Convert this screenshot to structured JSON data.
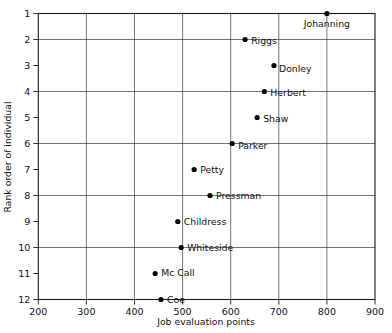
{
  "chart_data": {
    "type": "scatter",
    "title": "",
    "xlabel": "Job evaluation points",
    "ylabel": "Rank order of individual",
    "xlim": [
      200,
      900
    ],
    "ylim": [
      1,
      12
    ],
    "y_inverted": true,
    "grid": true,
    "legend": "none",
    "x_ticks": [
      200,
      300,
      400,
      500,
      600,
      700,
      800,
      900
    ],
    "x_tick_labels": [
      "200",
      "300",
      "400",
      "500",
      "600",
      "700",
      "800",
      "900"
    ],
    "y_ticks": [
      1,
      2,
      3,
      4,
      5,
      6,
      7,
      8,
      9,
      10,
      11,
      12
    ],
    "y_tick_labels": [
      "1",
      "2",
      "3",
      "4",
      "5",
      "6",
      "7",
      "8",
      "9",
      "10",
      "11",
      "12"
    ],
    "x_gridlines": [
      300,
      400,
      500,
      600,
      700,
      800
    ],
    "y_gridlines": [
      2,
      4,
      6,
      8,
      10,
      12
    ],
    "point_color": "#000000",
    "points": [
      {
        "label": "Johanning",
        "x": 800,
        "y": 1,
        "label_dx": 0,
        "label_dy": 13,
        "anchor": "middle"
      },
      {
        "label": "Riggs",
        "x": 630,
        "y": 2,
        "label_dx": 6,
        "label_dy": 4,
        "anchor": "start"
      },
      {
        "label": "Donley",
        "x": 690,
        "y": 3,
        "label_dx": 5,
        "label_dy": 6,
        "anchor": "start"
      },
      {
        "label": "Herbert",
        "x": 670,
        "y": 4,
        "label_dx": 6,
        "label_dy": 4,
        "anchor": "start"
      },
      {
        "label": "Shaw",
        "x": 655,
        "y": 5,
        "label_dx": 6,
        "label_dy": 4,
        "anchor": "start"
      },
      {
        "label": "Parker",
        "x": 603,
        "y": 6,
        "label_dx": 6,
        "label_dy": 5,
        "anchor": "start"
      },
      {
        "label": "Petty",
        "x": 524,
        "y": 7,
        "label_dx": 6,
        "label_dy": 3,
        "anchor": "start"
      },
      {
        "label": "Pressman",
        "x": 557,
        "y": 8,
        "label_dx": 6,
        "label_dy": 3,
        "anchor": "start"
      },
      {
        "label": "Childress",
        "x": 490,
        "y": 9,
        "label_dx": 6,
        "label_dy": 3,
        "anchor": "start"
      },
      {
        "label": "Whiteside",
        "x": 497,
        "y": 10,
        "label_dx": 6,
        "label_dy": 3,
        "anchor": "start"
      },
      {
        "label": "Mc Call",
        "x": 443,
        "y": 11,
        "label_dx": 6,
        "label_dy": 2,
        "anchor": "start"
      },
      {
        "label": "Coe",
        "x": 455,
        "y": 12,
        "label_dx": 6,
        "label_dy": 3,
        "anchor": "start"
      }
    ]
  }
}
